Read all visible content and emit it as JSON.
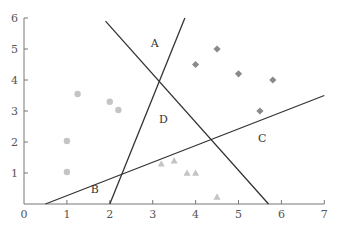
{
  "chart_data": {
    "type": "scatter",
    "title": "",
    "xlabel": "",
    "ylabel": "",
    "xlim": [
      0,
      7
    ],
    "ylim": [
      0,
      6
    ],
    "grid": false,
    "legend": "none",
    "x_ticks": [
      "0",
      "1",
      "2",
      "3",
      "4",
      "5",
      "6",
      "7"
    ],
    "y_ticks": [
      "1",
      "2",
      "3",
      "4",
      "5",
      "6"
    ],
    "series": [
      {
        "name": "circles",
        "marker": "circle",
        "color": "#c4c4c4",
        "points": [
          [
            1.25,
            3.55
          ],
          [
            2.0,
            3.3
          ],
          [
            2.2,
            3.03
          ],
          [
            1.0,
            2.03
          ],
          [
            1.0,
            1.03
          ]
        ]
      },
      {
        "name": "diamonds",
        "marker": "diamond",
        "color": "#8a8a8a",
        "points": [
          [
            4.0,
            4.5
          ],
          [
            4.5,
            5.0
          ],
          [
            5.0,
            4.2
          ],
          [
            5.8,
            4.0
          ],
          [
            5.5,
            3.0
          ]
        ]
      },
      {
        "name": "triangles",
        "marker": "triangle",
        "color": "#c4c4c4",
        "points": [
          [
            3.2,
            1.3
          ],
          [
            3.5,
            1.4
          ],
          [
            3.8,
            1.0
          ],
          [
            4.0,
            1.0
          ],
          [
            4.5,
            0.23
          ]
        ]
      }
    ],
    "lines": [
      {
        "name": "line-1",
        "from": [
          1.9,
          5.9
        ],
        "to": [
          5.7,
          0.0
        ]
      },
      {
        "name": "line-2",
        "from": [
          2.0,
          0.0
        ],
        "to": [
          3.75,
          6.0
        ]
      },
      {
        "name": "line-3",
        "from": [
          0.5,
          0.0
        ],
        "to": [
          7.0,
          3.5
        ]
      }
    ],
    "annotations": [
      {
        "text": "A",
        "x": 3.05,
        "y": 5.05
      },
      {
        "text": "B",
        "x": 1.65,
        "y": 0.35
      },
      {
        "text": "C",
        "x": 5.55,
        "y": 2.0
      },
      {
        "text": "D",
        "x": 3.25,
        "y": 2.6
      }
    ]
  }
}
